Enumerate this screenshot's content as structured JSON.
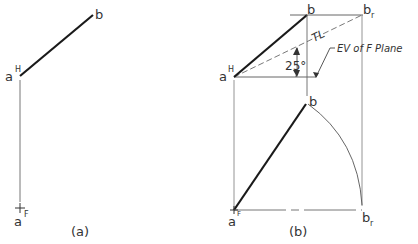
{
  "figure_a": {
    "caption": "(a)",
    "labels": {
      "a_top": "a",
      "a_top_sup": "H",
      "b_top": "b",
      "plus": "+",
      "a_front": "a",
      "a_front_sub": "F"
    }
  },
  "figure_b": {
    "caption": "(b)",
    "labels": {
      "a_top": "a",
      "a_top_sup": "H",
      "b_top": "b",
      "br_top": "b",
      "br_top_sub": "r",
      "tl": "TL",
      "angle": "25°",
      "ev_note": "EV of F Plane",
      "b_front": "b",
      "a_front": "a",
      "a_front_sub": "F",
      "br_front": "b",
      "br_front_sub": "r"
    }
  },
  "colors": {
    "line_thick": "#1a1a1a",
    "line_thin": "#555555",
    "text": "#333333"
  }
}
